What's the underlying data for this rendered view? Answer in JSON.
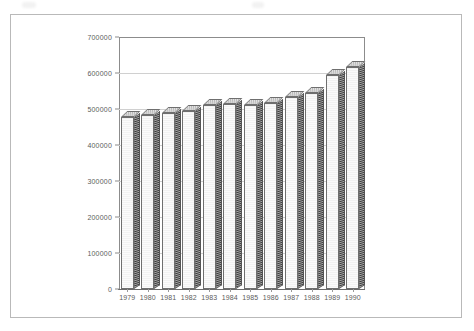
{
  "figure": {
    "frame_border_color": "#b9b9b9",
    "background_color": "#ffffff",
    "axis_color": "#8c8c8c",
    "grid_color": "#d0d0d0",
    "bar_front_color": "#f7f7f7",
    "bar_side_color": "#3d3d3d",
    "bar_top_color": "#bdbdbd",
    "tick_label_color": "#5c5c5c"
  },
  "chart_data": {
    "type": "bar",
    "title": "",
    "subtitle": "",
    "xlabel": "",
    "ylabel": "",
    "categories": [
      "1979",
      "1980",
      "1981",
      "1982",
      "1983",
      "1984",
      "1985",
      "1986",
      "1987",
      "1988",
      "1989",
      "1990"
    ],
    "values": [
      477000,
      483000,
      490000,
      495000,
      510000,
      515000,
      512000,
      517000,
      533000,
      545000,
      595000,
      617000
    ],
    "ylim": [
      0,
      700000
    ],
    "yticks": [
      0,
      100000,
      200000,
      300000,
      400000,
      500000,
      600000,
      700000
    ],
    "ytick_labels": [
      "0",
      "100000",
      "200000",
      "300000",
      "400000",
      "500000",
      "600000",
      "700000"
    ],
    "grid": true,
    "grid_axis": "y",
    "legend": false,
    "legend_position": "none",
    "style": "3d-column",
    "series": [
      {
        "name": "",
        "values": [
          477000,
          483000,
          490000,
          495000,
          510000,
          515000,
          512000,
          517000,
          533000,
          545000,
          595000,
          617000
        ]
      }
    ]
  }
}
